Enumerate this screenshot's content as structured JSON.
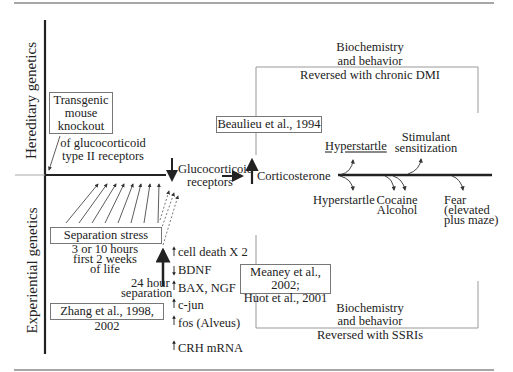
{
  "axes": {
    "vertical_top_label": "Hereditary genetics",
    "vertical_bottom_label": "Experiential genetics"
  },
  "hereditary": {
    "knockout_box": [
      "Transgenic",
      "mouse",
      "knockout"
    ],
    "knockout_caption": [
      "of glucocorticoid",
      "type II receptors"
    ],
    "beaulieu_box": "Beaulieu et al., 1994",
    "upper_bracket": {
      "lines": [
        "Biochemistry",
        "and behavior"
      ],
      "reversal": "Reversed with chronic DMI"
    },
    "above_line_effects": {
      "hyperstartle": "Hyperstartle",
      "stimulant": [
        "Stimulant",
        "sensitization"
      ]
    }
  },
  "central": {
    "glucocorticoid": [
      "Glucocorticoid",
      "receptors"
    ],
    "corticosterone": "Corticosterone"
  },
  "below_line_effects": {
    "hyperstartle": "Hyperstartle",
    "cocaine_alcohol": [
      "Cocaine",
      "Alcohol"
    ],
    "fear": [
      "Fear",
      "(elevated",
      "plus maze)"
    ]
  },
  "experiential": {
    "separation_box": "Separation stress",
    "separation_caption": [
      "3 or 10 hours",
      "first 2 weeks",
      "of life"
    ],
    "separation_24h": [
      "24 hour",
      "separation"
    ],
    "zhang_box": "Zhang et al., 1998, 2002",
    "markers": [
      {
        "dir": "up",
        "label": "cell death X 2"
      },
      {
        "dir": "down",
        "label": "BDNF"
      },
      {
        "dir": "up",
        "label": "BAX,  NGF"
      },
      {
        "dir": "up",
        "label": "c-jun"
      },
      {
        "dir": "up",
        "label": "fos (Alveus)"
      },
      {
        "dir": "up",
        "label": "CRH mRNA"
      }
    ],
    "meaney_box": [
      "Meaney et al., 2002;",
      "Huot et al., 2001"
    ],
    "lower_bracket": {
      "lines": [
        "Biochemistry",
        "and behavior"
      ],
      "reversal": "Reversed with SSRIs"
    }
  },
  "colors": {
    "rule": "#8a8a8a",
    "axis": "#222222",
    "bracket": "#999999",
    "text": "#222222"
  }
}
